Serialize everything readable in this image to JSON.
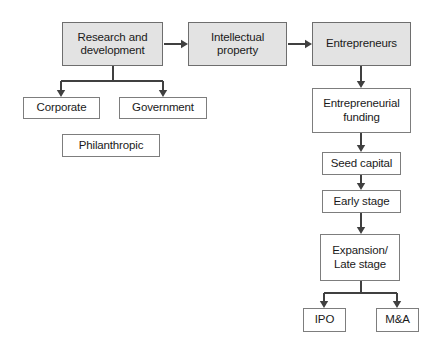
{
  "diagram": {
    "background_color": "#ffffff",
    "filled_node_color": "#e3e3e3",
    "plain_node_color": "#ffffff",
    "border_color": "#7d7d7d",
    "edge_color": "#404040",
    "text_color": "#1a1a1a",
    "nodes": [
      {
        "id": "research-and-development",
        "label": "Research and\ndevelopment",
        "style": "filled",
        "x": 62,
        "y": 22,
        "w": 101,
        "h": 44
      },
      {
        "id": "intellectual-property",
        "label": "Intellectual\nproperty",
        "style": "filled",
        "x": 188,
        "y": 22,
        "w": 99,
        "h": 44
      },
      {
        "id": "entrepreneurs",
        "label": "Entrepreneurs",
        "style": "filled",
        "x": 312,
        "y": 22,
        "w": 99,
        "h": 44
      },
      {
        "id": "corporate",
        "label": "Corporate",
        "style": "plain",
        "x": 23,
        "y": 97,
        "w": 77,
        "h": 22
      },
      {
        "id": "government",
        "label": "Government",
        "style": "plain",
        "x": 119,
        "y": 97,
        "w": 88,
        "h": 22
      },
      {
        "id": "philanthropic",
        "label": "Philanthropic",
        "style": "plain",
        "x": 62,
        "y": 134,
        "w": 98,
        "h": 23
      },
      {
        "id": "entrepreneurial-funding",
        "label": "Entrepreneurial\nfunding",
        "style": "plain",
        "x": 312,
        "y": 88,
        "w": 99,
        "h": 45
      },
      {
        "id": "seed-capital",
        "label": "Seed capital",
        "style": "plain",
        "x": 322,
        "y": 152,
        "w": 79,
        "h": 23
      },
      {
        "id": "early-stage",
        "label": "Early stage",
        "style": "plain",
        "x": 322,
        "y": 190,
        "w": 79,
        "h": 23
      },
      {
        "id": "expansion-late-stage",
        "label": "Expansion/\nLate stage",
        "style": "plain",
        "x": 320,
        "y": 234,
        "w": 80,
        "h": 47
      },
      {
        "id": "ipo",
        "label": "IPO",
        "style": "plain",
        "x": 303,
        "y": 308,
        "w": 43,
        "h": 24
      },
      {
        "id": "m-and-a",
        "label": "M&A",
        "style": "plain",
        "x": 376,
        "y": 308,
        "w": 43,
        "h": 24
      }
    ],
    "edges": [
      {
        "id": "rd-to-ip",
        "from": "research-and-development",
        "to": "intellectual-property",
        "kind": "horizontal-arrow",
        "path": "M 164 44 L 185 44",
        "arrow_at": [
          187,
          44
        ],
        "arrow_dir": "right"
      },
      {
        "id": "ip-to-entrepreneurs",
        "from": "intellectual-property",
        "to": "entrepreneurs",
        "kind": "horizontal-arrow",
        "path": "M 288 44 L 309 44",
        "arrow_at": [
          311,
          44
        ],
        "arrow_dir": "right"
      },
      {
        "id": "rd-branch-stem",
        "from": "research-and-development",
        "to": "branch-bar",
        "kind": "line",
        "path": "M 113 66 L 113 81"
      },
      {
        "id": "rd-branch-bar",
        "from": "branch-bar",
        "to": "branch-bar",
        "kind": "line",
        "path": "M 61 81 L 163 81"
      },
      {
        "id": "rd-to-corporate",
        "from": "branch-bar",
        "to": "corporate",
        "kind": "vertical-arrow",
        "path": "M 61 81 L 61 94",
        "arrow_at": [
          61,
          96
        ],
        "arrow_dir": "down"
      },
      {
        "id": "rd-to-government",
        "from": "branch-bar",
        "to": "government",
        "kind": "vertical-arrow",
        "path": "M 163 81 L 163 94",
        "arrow_at": [
          163,
          96
        ],
        "arrow_dir": "down"
      },
      {
        "id": "entrepreneurs-to-funding",
        "from": "entrepreneurs",
        "to": "entrepreneurial-funding",
        "kind": "vertical-arrow",
        "path": "M 361 66 L 361 85",
        "arrow_at": [
          361,
          87
        ],
        "arrow_dir": "down"
      },
      {
        "id": "funding-to-seed",
        "from": "entrepreneurial-funding",
        "to": "seed-capital",
        "kind": "vertical-arrow",
        "path": "M 361 133 L 361 149",
        "arrow_at": [
          361,
          151
        ],
        "arrow_dir": "down"
      },
      {
        "id": "seed-to-early",
        "from": "seed-capital",
        "to": "early-stage",
        "kind": "vertical-arrow",
        "path": "M 361 175 L 361 187",
        "arrow_at": [
          361,
          189
        ],
        "arrow_dir": "down"
      },
      {
        "id": "early-to-expansion",
        "from": "early-stage",
        "to": "expansion-late-stage",
        "kind": "vertical-arrow",
        "path": "M 361 213 L 361 231",
        "arrow_at": [
          361,
          233
        ],
        "arrow_dir": "down"
      },
      {
        "id": "expansion-branch-stem",
        "from": "expansion-late-stage",
        "to": "exit-bar",
        "kind": "line",
        "path": "M 361 281 L 361 293"
      },
      {
        "id": "expansion-branch-bar",
        "from": "exit-bar",
        "to": "exit-bar",
        "kind": "line",
        "path": "M 324 293 L 397 293"
      },
      {
        "id": "expansion-to-ipo",
        "from": "exit-bar",
        "to": "ipo",
        "kind": "vertical-arrow",
        "path": "M 324 293 L 324 305",
        "arrow_at": [
          324,
          307
        ],
        "arrow_dir": "down"
      },
      {
        "id": "expansion-to-ma",
        "from": "exit-bar",
        "to": "m-and-a",
        "kind": "vertical-arrow",
        "path": "M 397 293 L 397 305",
        "arrow_at": [
          397,
          307
        ],
        "arrow_dir": "down"
      }
    ]
  }
}
